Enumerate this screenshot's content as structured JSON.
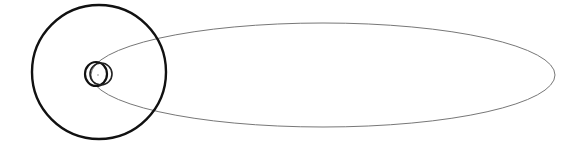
{
  "diagram": {
    "background": "#ffffff",
    "shapes": {
      "outer_orbit": {
        "cx": 99,
        "cy": 72,
        "r": 67,
        "stroke": "#111111",
        "width": 2.4
      },
      "inner_orbit_a": {
        "cx": 96,
        "cy": 74,
        "rx": 11,
        "ry": 12,
        "stroke": "#111111",
        "width": 2.2
      },
      "inner_orbit_b": {
        "cx": 101,
        "cy": 74,
        "rx": 11,
        "ry": 11,
        "stroke": "#222222",
        "width": 1.6
      },
      "eccentric_orbit": {
        "cx": 323,
        "cy": 75,
        "rx": 232,
        "ry": 52,
        "stroke": "#777777",
        "width": 1.0
      },
      "sun": {
        "cx": 98,
        "cy": 75,
        "r": 1,
        "fill": "#bbbbbb"
      }
    }
  }
}
